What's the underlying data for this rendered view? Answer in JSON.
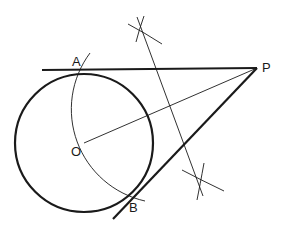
{
  "diagram": {
    "points": [
      {
        "id": "A",
        "label": "A",
        "x": 84,
        "y": 70,
        "lx": 72,
        "ly": 66
      },
      {
        "id": "P",
        "label": "P",
        "x": 257,
        "y": 68,
        "lx": 262,
        "ly": 72
      },
      {
        "id": "O",
        "label": "O",
        "x": 84,
        "y": 143,
        "lx": 71,
        "ly": 150
      },
      {
        "id": "B",
        "label": "B",
        "x": 134,
        "y": 194,
        "lx": 129,
        "ly": 212
      }
    ],
    "circle": {
      "cx": 84,
      "cy": 143,
      "r": 69
    },
    "colors": {
      "stroke": "#1a1a1a",
      "background": "#ffffff"
    }
  }
}
